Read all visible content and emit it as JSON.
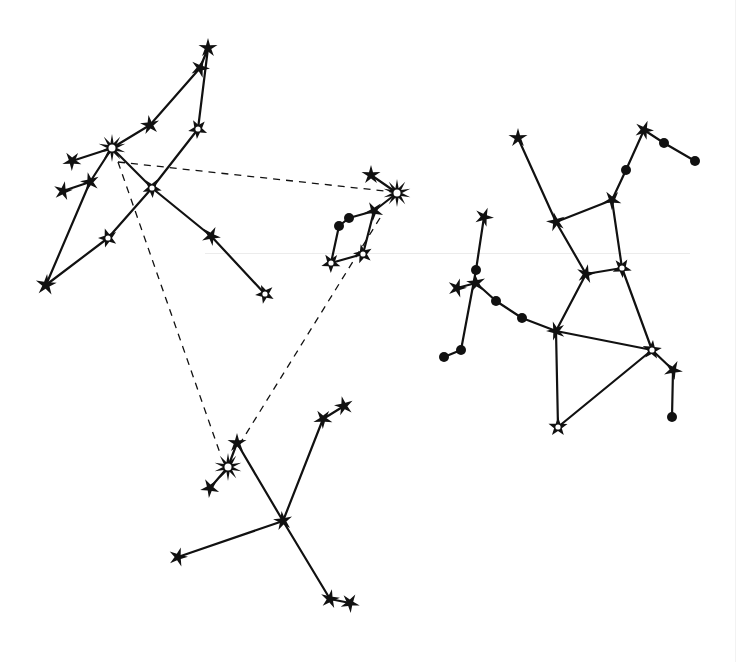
{
  "title": "",
  "colors": {
    "ink": "#111111",
    "background": "#ffffff",
    "hollow_fill": "#ffffff"
  },
  "legend": [],
  "asterism": {
    "name": "dashed triangle",
    "segments": [
      {
        "from": [
          118,
          162
        ],
        "to": [
          394,
          192
        ]
      },
      {
        "from": [
          118,
          162
        ],
        "to": [
          221,
          456
        ]
      },
      {
        "from": [
          380,
          218
        ],
        "to": [
          236,
          450
        ]
      }
    ]
  },
  "constellations": [
    {
      "id": "upper-left",
      "stars": [
        {
          "id": "ul1",
          "x": 208,
          "y": 48,
          "type": "star",
          "r": 9
        },
        {
          "id": "ul2",
          "x": 200,
          "y": 68,
          "type": "star",
          "r": 9
        },
        {
          "id": "ul3",
          "x": 198,
          "y": 129,
          "type": "hollow",
          "r": 9
        },
        {
          "id": "ul4",
          "x": 150,
          "y": 125,
          "type": "star",
          "r": 9
        },
        {
          "id": "ul5",
          "x": 112,
          "y": 148,
          "type": "bright",
          "r": 12
        },
        {
          "id": "ul6",
          "x": 72,
          "y": 161,
          "type": "star",
          "r": 9
        },
        {
          "id": "ul7",
          "x": 90,
          "y": 182,
          "type": "star",
          "r": 9
        },
        {
          "id": "ul8",
          "x": 63,
          "y": 191,
          "type": "star",
          "r": 9
        },
        {
          "id": "ul9",
          "x": 152,
          "y": 188,
          "type": "hollow",
          "r": 9
        },
        {
          "id": "ul10",
          "x": 108,
          "y": 238,
          "type": "hollow",
          "r": 9
        },
        {
          "id": "ul11",
          "x": 46,
          "y": 285,
          "type": "star",
          "r": 10
        },
        {
          "id": "ul12",
          "x": 211,
          "y": 236,
          "type": "star",
          "r": 9
        },
        {
          "id": "ul13",
          "x": 265,
          "y": 294,
          "type": "hollow",
          "r": 9
        }
      ],
      "edges": [
        [
          "ul1",
          "ul2"
        ],
        [
          "ul2",
          "ul4"
        ],
        [
          "ul4",
          "ul5"
        ],
        [
          "ul1",
          "ul3"
        ],
        [
          "ul3",
          "ul9"
        ],
        [
          "ul9",
          "ul10"
        ],
        [
          "ul10",
          "ul11"
        ],
        [
          "ul5",
          "ul6"
        ],
        [
          "ul5",
          "ul7"
        ],
        [
          "ul7",
          "ul11"
        ],
        [
          "ul7",
          "ul8"
        ],
        [
          "ul5",
          "ul9"
        ],
        [
          "ul9",
          "ul12"
        ],
        [
          "ul12",
          "ul13"
        ]
      ]
    },
    {
      "id": "middle",
      "stars": [
        {
          "id": "m1",
          "x": 371,
          "y": 175,
          "type": "star",
          "r": 9
        },
        {
          "id": "m2",
          "x": 397,
          "y": 193,
          "type": "bright",
          "r": 12
        },
        {
          "id": "m3",
          "x": 374,
          "y": 211,
          "type": "star",
          "r": 9
        },
        {
          "id": "m4",
          "x": 349,
          "y": 218,
          "type": "dot",
          "r": 5
        },
        {
          "id": "m5",
          "x": 339,
          "y": 226,
          "type": "dot",
          "r": 5
        },
        {
          "id": "m6",
          "x": 331,
          "y": 263,
          "type": "hollow",
          "r": 9
        },
        {
          "id": "m7",
          "x": 363,
          "y": 254,
          "type": "hollow",
          "r": 9
        }
      ],
      "edges": [
        [
          "m1",
          "m2"
        ],
        [
          "m2",
          "m3"
        ],
        [
          "m3",
          "m4"
        ],
        [
          "m4",
          "m5"
        ],
        [
          "m5",
          "m6"
        ],
        [
          "m6",
          "m7"
        ],
        [
          "m7",
          "m3"
        ]
      ]
    },
    {
      "id": "right",
      "stars": [
        {
          "id": "r1",
          "x": 518,
          "y": 138,
          "type": "star",
          "r": 9
        },
        {
          "id": "r2",
          "x": 644,
          "y": 130,
          "type": "star",
          "r": 9
        },
        {
          "id": "r3",
          "x": 664,
          "y": 143,
          "type": "dot",
          "r": 5
        },
        {
          "id": "r4",
          "x": 695,
          "y": 161,
          "type": "dot",
          "r": 5
        },
        {
          "id": "r5",
          "x": 626,
          "y": 170,
          "type": "dot",
          "r": 5
        },
        {
          "id": "r6",
          "x": 612,
          "y": 200,
          "type": "star",
          "r": 9
        },
        {
          "id": "r7",
          "x": 556,
          "y": 222,
          "type": "star",
          "r": 9
        },
        {
          "id": "r8",
          "x": 586,
          "y": 274,
          "type": "star",
          "r": 9
        },
        {
          "id": "r9",
          "x": 622,
          "y": 268,
          "type": "hollow",
          "r": 9
        },
        {
          "id": "r10",
          "x": 556,
          "y": 331,
          "type": "star",
          "r": 9
        },
        {
          "id": "r11",
          "x": 652,
          "y": 350,
          "type": "hollow",
          "r": 9
        },
        {
          "id": "r12",
          "x": 673,
          "y": 370,
          "type": "star",
          "r": 9
        },
        {
          "id": "r13",
          "x": 672,
          "y": 417,
          "type": "dot",
          "r": 5
        },
        {
          "id": "r14",
          "x": 558,
          "y": 427,
          "type": "hollow",
          "r": 9
        },
        {
          "id": "r15",
          "x": 484,
          "y": 217,
          "type": "star",
          "r": 9
        },
        {
          "id": "r16",
          "x": 476,
          "y": 270,
          "type": "dot",
          "r": 5
        },
        {
          "id": "r17",
          "x": 476,
          "y": 283,
          "type": "star",
          "r": 9
        },
        {
          "id": "r18",
          "x": 457,
          "y": 288,
          "type": "star",
          "r": 9
        },
        {
          "id": "r19",
          "x": 496,
          "y": 301,
          "type": "dot",
          "r": 5
        },
        {
          "id": "r20",
          "x": 522,
          "y": 318,
          "type": "dot",
          "r": 5
        },
        {
          "id": "r21",
          "x": 461,
          "y": 350,
          "type": "dot",
          "r": 5
        },
        {
          "id": "r22",
          "x": 444,
          "y": 357,
          "type": "dot",
          "r": 5
        }
      ],
      "edges": [
        [
          "r2",
          "r3"
        ],
        [
          "r3",
          "r4"
        ],
        [
          "r2",
          "r5"
        ],
        [
          "r5",
          "r6"
        ],
        [
          "r6",
          "r7"
        ],
        [
          "r1",
          "r7"
        ],
        [
          "r7",
          "r8"
        ],
        [
          "r8",
          "r9"
        ],
        [
          "r6",
          "r9"
        ],
        [
          "r8",
          "r10"
        ],
        [
          "r9",
          "r11"
        ],
        [
          "r10",
          "r11"
        ],
        [
          "r11",
          "r12"
        ],
        [
          "r12",
          "r13"
        ],
        [
          "r10",
          "r14"
        ],
        [
          "r14",
          "r11"
        ],
        [
          "r17",
          "r19"
        ],
        [
          "r19",
          "r20"
        ],
        [
          "r20",
          "r10"
        ],
        [
          "r15",
          "r16"
        ],
        [
          "r16",
          "r21"
        ],
        [
          "r18",
          "r17"
        ],
        [
          "r21",
          "r22"
        ]
      ]
    },
    {
      "id": "bottom",
      "stars": [
        {
          "id": "b1",
          "x": 237,
          "y": 443,
          "type": "star",
          "r": 9
        },
        {
          "id": "b2",
          "x": 228,
          "y": 467,
          "type": "bright",
          "r": 12
        },
        {
          "id": "b3",
          "x": 210,
          "y": 488,
          "type": "star",
          "r": 9
        },
        {
          "id": "b4",
          "x": 283,
          "y": 521,
          "type": "star",
          "r": 9
        },
        {
          "id": "b5",
          "x": 178,
          "y": 557,
          "type": "star",
          "r": 9
        },
        {
          "id": "b6",
          "x": 323,
          "y": 419,
          "type": "star",
          "r": 9
        },
        {
          "id": "b7",
          "x": 344,
          "y": 406,
          "type": "star",
          "r": 9
        },
        {
          "id": "b8",
          "x": 330,
          "y": 599,
          "type": "star",
          "r": 9
        },
        {
          "id": "b9",
          "x": 350,
          "y": 603,
          "type": "star",
          "r": 9
        }
      ],
      "edges": [
        [
          "b1",
          "b2"
        ],
        [
          "b2",
          "b3"
        ],
        [
          "b1",
          "b4"
        ],
        [
          "b4",
          "b5"
        ],
        [
          "b4",
          "b6"
        ],
        [
          "b6",
          "b7"
        ],
        [
          "b4",
          "b8"
        ],
        [
          "b8",
          "b9"
        ]
      ]
    }
  ]
}
